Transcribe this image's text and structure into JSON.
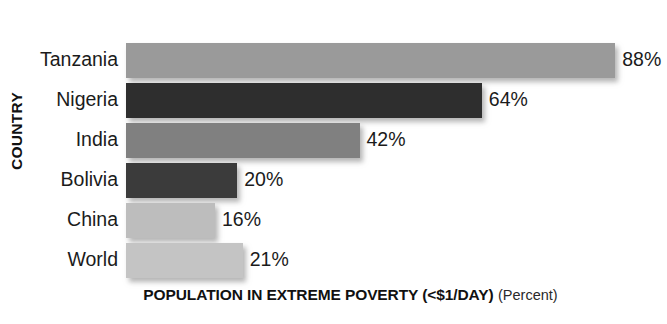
{
  "chart_data": {
    "type": "bar",
    "orientation": "horizontal",
    "title": "",
    "xlabel": "POPULATION IN EXTREME POVERTY (<$1/DAY)",
    "xlabel_suffix": "(Percent)",
    "ylabel": "COUNTRY",
    "categories": [
      "Tanzania",
      "Nigeria",
      "India",
      "Bolivia",
      "China",
      "World"
    ],
    "values": [
      88,
      64,
      42,
      20,
      16,
      21
    ],
    "value_labels": [
      "88%",
      "64%",
      "42%",
      "20%",
      "16%",
      "21%"
    ],
    "xlim": [
      0,
      100
    ],
    "grid": false,
    "legend": "none",
    "bar_colors": [
      "#9a9a9a",
      "#2e2e2e",
      "#808080",
      "#3b3b3b",
      "#bdbdbd",
      "#c4c4c4"
    ],
    "bars": [
      {
        "category": "Tanzania",
        "value": 88,
        "label": "88%",
        "color": "#9a9a9a"
      },
      {
        "category": "Nigeria",
        "value": 64,
        "label": "64%",
        "color": "#2e2e2e"
      },
      {
        "category": "India",
        "value": 42,
        "label": "42%",
        "color": "#808080"
      },
      {
        "category": "Bolivia",
        "value": 20,
        "label": "20%",
        "color": "#3b3b3b"
      },
      {
        "category": "China",
        "value": 16,
        "label": "16%",
        "color": "#bdbdbd"
      },
      {
        "category": "World",
        "value": 21,
        "label": "21%",
        "color": "#c4c4c4"
      }
    ],
    "background_color": "#ffffff",
    "text_color": "#1b1b1b"
  }
}
